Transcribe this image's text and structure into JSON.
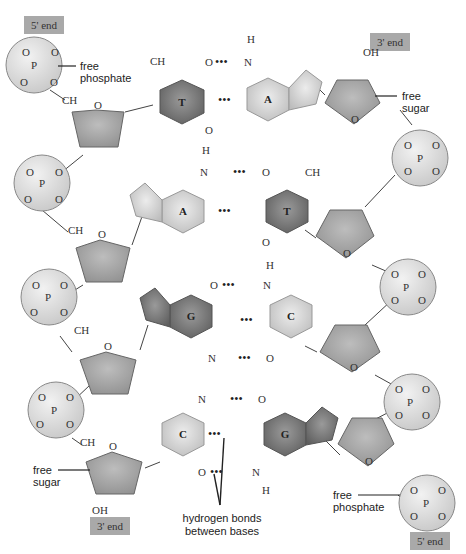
{
  "colors": {
    "end_label_bg": "#a9a9a9",
    "phosphate_fill": "#dcdcdc",
    "sugar_fill": "#a8a8a8",
    "purine_fill": "#cfcfcf",
    "pyrimidine_dark_fill": "#7c7c7c",
    "pyrimidine_light_fill": "#cfcfcf",
    "text": "#333333"
  },
  "end_labels": {
    "top_left": "5' end",
    "top_right": "3' end",
    "bottom_left": "3' end",
    "bottom_right": "5' end"
  },
  "annotations": {
    "free_phosphate_top": [
      "free",
      "phosphate"
    ],
    "free_sugar_top": [
      "free",
      "sugar"
    ],
    "free_sugar_bottom": [
      "free",
      "sugar"
    ],
    "free_phosphate_bottom": [
      "free",
      "phosphate"
    ],
    "hydrogen_bonds": [
      "hydrogen bonds",
      "between bases"
    ]
  },
  "base_pairs": [
    {
      "left": "T",
      "right": "A",
      "hbonds": 2
    },
    {
      "left": "A",
      "right": "T",
      "hbonds": 2
    },
    {
      "left": "G",
      "right": "C",
      "hbonds": 3
    },
    {
      "left": "C",
      "right": "G",
      "hbonds": 3
    }
  ],
  "atoms": {
    "P": "P",
    "O": "O",
    "C": "C",
    "H": "H",
    "N": "N",
    "CH2": "CH",
    "H2C": "H",
    "CH3": "CH",
    "OH": "OH",
    "sub2": "2",
    "sub3": "3",
    "NH": "N",
    "dots": "•••"
  }
}
